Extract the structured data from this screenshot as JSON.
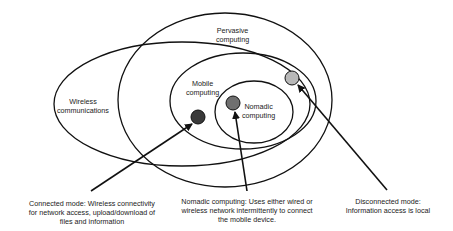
{
  "diagram": {
    "regions": {
      "pervasive": "Pervasive computing",
      "wireless": "Wireless communications",
      "mobile": "Mobile computing",
      "nomadic": "Nomadic computing"
    },
    "region_lines": {
      "pervasive_1": "Pervasive",
      "pervasive_2": "computing",
      "wireless_1": "Wireless",
      "wireless_2": "communications",
      "mobile_1": "Mobile",
      "mobile_2": "computing",
      "nomadic_1": "Nomadic",
      "nomadic_2": "computing"
    },
    "annotations": {
      "connected": {
        "line1": "Connected mode: Wireless connectivity",
        "line2": "for network access, upload/download of",
        "line3": "files and information"
      },
      "nomadic": {
        "line1": "Nomadic computing: Uses either wired or",
        "line2": "wireless network intermittently to connect",
        "line3": "the mobile device."
      },
      "disconnected": {
        "line1": "Disconnected mode:",
        "line2": "Information access is local"
      }
    },
    "colors": {
      "connected_dot": "#3a3a3a",
      "nomadic_dot": "#707070",
      "disconnected_dot": "#b8b8b8",
      "stroke": "#111111"
    }
  }
}
